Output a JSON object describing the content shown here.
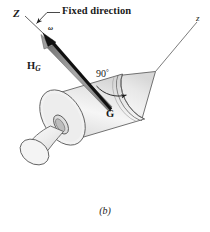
{
  "figure": {
    "caption": "(b)",
    "labels": {
      "axis_Z": "Z",
      "axis_z": "z",
      "fixed_direction": "Fixed direction",
      "omega": "ω",
      "angular_momentum": "H",
      "angular_momentum_sub": "G",
      "angle": "90",
      "angle_degree": "°",
      "center_of_mass": "G"
    },
    "colors": {
      "stroke": "#4a4a4a",
      "body_fill": "#ededed",
      "body_fill_light": "#f7f7f7",
      "body_fill_dark": "#dcdcdc",
      "vector_black": "#111111",
      "vector_gray": "#8c8c8c",
      "axis_line": "#5a5a5a",
      "text": "#1a1a1a",
      "background": "#ffffff"
    },
    "geometry": {
      "center_of_mass_point": [
        110,
        110
      ],
      "omega_tip": [
        43,
        33
      ],
      "z_axis_start": [
        155,
        72
      ],
      "z_axis_end": [
        197,
        22
      ],
      "angle_value_deg": 90
    }
  }
}
